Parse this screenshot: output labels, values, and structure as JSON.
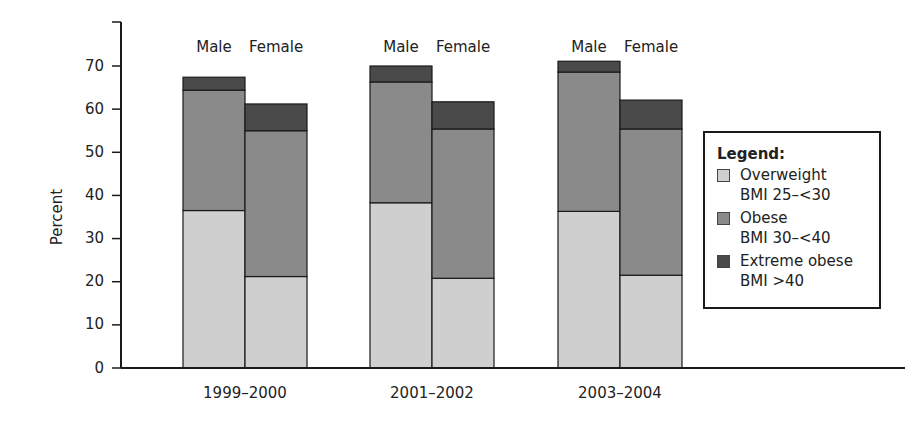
{
  "chart_data": {
    "type": "bar",
    "stacked": true,
    "title": "",
    "xlabel": "",
    "ylabel": "Percent",
    "ylim": [
      0,
      70
    ],
    "yticks": [
      0,
      10,
      20,
      30,
      40,
      50,
      60,
      70
    ],
    "grid": false,
    "categories": [
      "1999–2000",
      "2001–2002",
      "2003–2004"
    ],
    "groups": [
      "Male",
      "Female"
    ],
    "series": [
      {
        "name": "Overweight BMI 25–<30",
        "color": "#cfcfcf",
        "values": {
          "Male": [
            36.5,
            38.3,
            36.3
          ],
          "Female": [
            21.2,
            20.8,
            21.5
          ]
        }
      },
      {
        "name": "Obese BMI 30–<40",
        "color": "#8a8a8a",
        "values": {
          "Male": [
            27.9,
            28.0,
            32.3
          ],
          "Female": [
            33.8,
            34.6,
            33.9
          ]
        }
      },
      {
        "name": "Extreme obese BMI >40",
        "color": "#4a4a4a",
        "values": {
          "Male": [
            3.0,
            3.7,
            2.5
          ],
          "Female": [
            6.2,
            6.3,
            6.7
          ]
        }
      }
    ],
    "totals": {
      "Male": [
        67.4,
        70.0,
        71.1
      ],
      "Female": [
        61.2,
        61.7,
        62.1
      ]
    },
    "legend": {
      "position": "right",
      "title": "Legend:",
      "items": [
        {
          "label": "Overweight",
          "sub": "BMI 25–<30",
          "color": "#cfcfcf"
        },
        {
          "label": "Obese",
          "sub": "BMI 30–<40",
          "color": "#8a8a8a"
        },
        {
          "label": "Extreme obese",
          "sub": "BMI >40",
          "color": "#4a4a4a"
        }
      ]
    }
  }
}
